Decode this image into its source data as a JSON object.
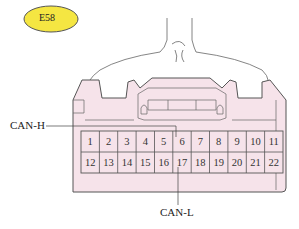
{
  "connector": {
    "id_badge": "E58",
    "badge_color": "#f5e642",
    "body_color": "#f6e3ea",
    "outline_color": "#555555",
    "pins_row1": [
      "1",
      "2",
      "3",
      "4",
      "5",
      "6",
      "7",
      "8",
      "9",
      "10",
      "11"
    ],
    "pins_row2": [
      "12",
      "13",
      "14",
      "15",
      "16",
      "17",
      "18",
      "19",
      "20",
      "21",
      "22"
    ]
  },
  "labels": {
    "can_h": "CAN-H",
    "can_l": "CAN-L"
  }
}
